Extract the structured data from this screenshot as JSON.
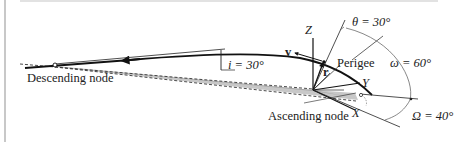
{
  "diagram": {
    "type": "orbital-elements",
    "labels": {
      "descending_node": "Descending node",
      "ascending_node": "Ascending node",
      "perigee": "Perigee",
      "inclination": "i = 30°",
      "true_anomaly": "θ = 30°",
      "arg_perigee": "ω = 60°",
      "raan": "Ω = 40°",
      "axis_x": "X",
      "axis_y": "Y",
      "axis_z": "Z",
      "velocity": "v",
      "position": "r"
    },
    "values": {
      "inclination_deg": 30,
      "true_anomaly_deg": 30,
      "arg_perigee_deg": 60,
      "raan_deg": 40
    }
  }
}
